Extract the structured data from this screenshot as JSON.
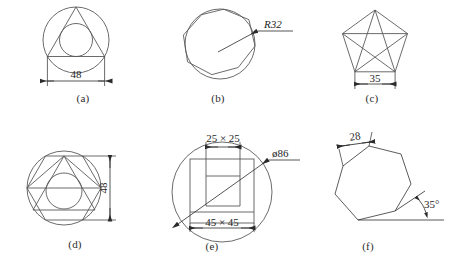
{
  "sheet": {
    "background": "#ffffff",
    "line_color": "#5a5a5a",
    "dim_color": "#2b2b2b"
  },
  "figures": [
    {
      "id": "a",
      "caption": "(a)",
      "shapes": [
        "circle",
        "triangle-inscribed",
        "circle-inscribed-in-triangle"
      ],
      "dimensions": [
        {
          "name": "base-width",
          "label": "48",
          "orientation": "horizontal"
        }
      ]
    },
    {
      "id": "b",
      "caption": "(b)",
      "shapes": [
        "circle",
        "octagon-inscribed"
      ],
      "dimensions": [
        {
          "name": "radius",
          "label": "R32",
          "orientation": "leader",
          "style": "italic"
        }
      ]
    },
    {
      "id": "c",
      "caption": "(c)",
      "shapes": [
        "pentagon",
        "pentagram-diagonals"
      ],
      "dimensions": [
        {
          "name": "base-width",
          "label": "35",
          "orientation": "horizontal"
        }
      ]
    },
    {
      "id": "d",
      "caption": "(d)",
      "shapes": [
        "circle",
        "hexagon-inscribed",
        "triangle-inscribed",
        "circle-inscribed-in-triangle"
      ],
      "dimensions": [
        {
          "name": "height",
          "label": "48",
          "orientation": "vertical"
        }
      ]
    },
    {
      "id": "e",
      "caption": "(e)",
      "shapes": [
        "circle",
        "square-outer",
        "slot-rectangle"
      ],
      "dimensions": [
        {
          "name": "slot-size",
          "label": "25 × 25",
          "orientation": "horizontal"
        },
        {
          "name": "square-size",
          "label": "45 × 45",
          "orientation": "horizontal"
        },
        {
          "name": "diameter",
          "label": "̈86",
          "orientation": "diagonal"
        }
      ]
    },
    {
      "id": "f",
      "caption": "(f)",
      "shapes": [
        "heptagon",
        "angle-reference-lines"
      ],
      "dimensions": [
        {
          "name": "top-edge",
          "label": "28",
          "orientation": "aligned"
        },
        {
          "name": "angle",
          "label": "35°",
          "orientation": "angular"
        }
      ]
    }
  ],
  "labels": {
    "a_caption": "(a)",
    "b_caption": "(b)",
    "c_caption": "(c)",
    "d_caption": "(d)",
    "e_caption": "(e)",
    "f_caption": "(f)",
    "a_dim48": "48",
    "b_R32": "R32",
    "c_dim35": "35",
    "d_dim48": "48",
    "e_dim2525": "25 × 25",
    "e_dim4545": "45 × 45",
    "e_diam86": "ø86",
    "f_dim28": "28",
    "f_angle35": "35°"
  }
}
